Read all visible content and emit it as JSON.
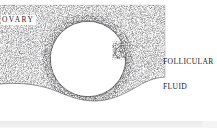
{
  "figure": {
    "type": "anatomical-line-drawing",
    "medium": "stippled engraving / halftone scan",
    "ink_color": "#3a3a3a",
    "paper_color": "#ffffff",
    "labels": {
      "ovary": "OVARY",
      "follicular_fluid_line1": "FOLLICULAR",
      "follicular_fluid_line2": "FLUID"
    },
    "structures": {
      "ovarian_stroma": "stippled tissue slab",
      "follicle_antrum": "large white circle",
      "oocyte_cumulus": "small dark mass on right inner wall of follicle"
    },
    "geometry": {
      "tissue_left": 0,
      "tissue_right": 165,
      "tissue_top": 5,
      "tissue_bottom": 100,
      "follicle_center_x": 88,
      "follicle_center_y": 59,
      "follicle_radius": 38
    }
  },
  "bottom_strip": {
    "description": "top sliver of the following figure plate",
    "color": "#eeeeee"
  }
}
